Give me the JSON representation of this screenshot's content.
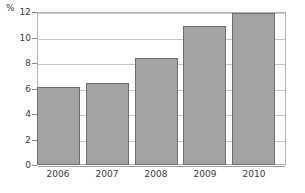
{
  "chart_data": {
    "type": "bar",
    "title": "",
    "subtitle": "",
    "xlabel": "",
    "ylabel": "%",
    "unit_label": "%",
    "categories": [
      "2006",
      "2007",
      "2008",
      "2009",
      "2010"
    ],
    "values": [
      6.1,
      6.4,
      8.4,
      10.9,
      11.95
    ],
    "series": [
      {
        "name": "",
        "values": [
          6.1,
          6.4,
          8.4,
          10.9,
          11.95
        ]
      }
    ],
    "ylim": [
      0,
      12
    ],
    "xlim_note": "categorical",
    "yticks": [
      0,
      2,
      4,
      6,
      8,
      10,
      12
    ],
    "ytick_labels": [
      "0",
      "2",
      "4",
      "6",
      "8",
      "10",
      "12"
    ],
    "grid": "horizontal",
    "legend": "none",
    "legend_position": "",
    "annotations": [],
    "colors": {
      "bar_fill": "#a3a3a3",
      "bar_border": "#6f6f6f",
      "gridline": "#c8c8c8",
      "axis_line": "#9a9a9a",
      "plot_border": "#b4b4b4",
      "text": "#3a3a3a",
      "background": "#ffffff"
    }
  }
}
